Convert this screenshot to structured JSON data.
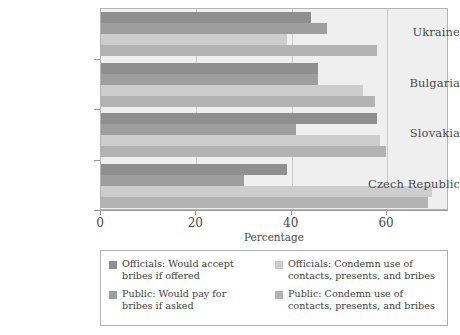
{
  "chart_data": {
    "type": "bar",
    "orientation": "horizontal",
    "title": "",
    "xlabel": "Percentage",
    "ylabel": "",
    "xlim": [
      0,
      73
    ],
    "xticks": [
      0,
      20,
      40,
      60
    ],
    "xticklabels": [
      "0",
      "20",
      "40",
      "60"
    ],
    "grid": true,
    "grid_axis": "x",
    "legend_position": "bottom",
    "categories": [
      "Ukraine",
      "Bulgaria",
      "Slovakia",
      "Czech Republic"
    ],
    "series": [
      {
        "name": "Officials: Would accept bribes if offered",
        "color": "#8f8f8f",
        "values": [
          44,
          45.5,
          58,
          39
        ]
      },
      {
        "name": "Public: Would pay for bribes if asked",
        "color": "#9e9e9e",
        "values": [
          47.5,
          45.5,
          41,
          30
        ]
      },
      {
        "name": "Officials: Condemn use of contacts, presents, and bribes",
        "color": "#cdcdcd",
        "values": [
          39,
          55,
          58.5,
          69.5
        ]
      },
      {
        "name": "Public: Condemn use of contacts, presents, and bribes",
        "color": "#b3b3b3",
        "values": [
          58,
          57.5,
          59.8,
          68.5
        ]
      }
    ]
  },
  "legend": {
    "entries": [
      {
        "label_line1": "Officials: Would accept",
        "label_line2": "bribes if offered",
        "swatch": "#8f8f8f"
      },
      {
        "label_line1": "Officials: Condemn use of",
        "label_line2": "contacts, presents, and bribes",
        "swatch": "#cdcdcd"
      },
      {
        "label_line1": "Public: Would pay for",
        "label_line2": "bribes if asked",
        "swatch": "#9e9e9e"
      },
      {
        "label_line1": "Public: Condemn use of",
        "label_line2": "contacts, presents, and bribes",
        "swatch": "#b3b3b3"
      }
    ]
  },
  "axis": {
    "x_title": "Percentage",
    "x_tick_labels": [
      "0",
      "20",
      "40",
      "60"
    ],
    "y_tick_labels": [
      "Ukraine",
      "Bulgaria",
      "Slovakia",
      "Czech Republic"
    ]
  }
}
